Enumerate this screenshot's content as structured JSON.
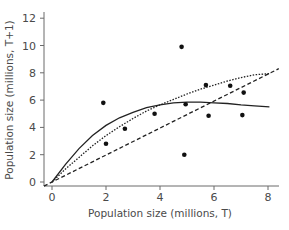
{
  "chart_data": {
    "type": "scatter",
    "title": "",
    "xlabel": "Population size (millions, T)",
    "ylabel": "Population size (millions, T+1)",
    "xlim": [
      -0.3,
      8.3
    ],
    "ylim": [
      -0.3,
      12.5
    ],
    "x_ticks": [
      "0",
      "2",
      "4",
      "6",
      "8"
    ],
    "x_tick_values": [
      0,
      2,
      4,
      6,
      8
    ],
    "y_ticks": [
      "0",
      "2",
      "4",
      "6",
      "8",
      "10",
      "12"
    ],
    "y_tick_values": [
      0,
      2,
      4,
      6,
      8,
      10,
      12
    ],
    "grid": false,
    "legend": null,
    "series": [
      {
        "name": "Observed data",
        "kind": "points",
        "x": [
          1.9,
          2.0,
          2.7,
          3.8,
          4.8,
          4.95,
          4.9,
          5.7,
          5.8,
          6.6,
          7.1,
          7.05
        ],
        "y": [
          5.8,
          2.8,
          3.9,
          5.0,
          9.9,
          5.7,
          2.0,
          7.1,
          4.85,
          7.05,
          6.55,
          4.9
        ]
      },
      {
        "name": "Solid model curve",
        "kind": "line-solid",
        "x": [
          0,
          0.5,
          1,
          1.5,
          2,
          2.5,
          3,
          3.5,
          4,
          4.5,
          5,
          5.5,
          6,
          6.5,
          7,
          7.5,
          8.05
        ],
        "y": [
          0,
          1.3,
          2.45,
          3.4,
          4.15,
          4.7,
          5.1,
          5.45,
          5.65,
          5.8,
          5.85,
          5.85,
          5.8,
          5.75,
          5.65,
          5.58,
          5.5
        ]
      },
      {
        "name": "Dotted model curve",
        "kind": "line-dotted",
        "x": [
          0,
          0.5,
          1,
          1.5,
          2,
          2.5,
          3,
          3.5,
          4,
          4.5,
          5,
          5.5,
          6,
          6.5,
          7,
          7.5,
          8.1
        ],
        "y": [
          0,
          0.95,
          1.8,
          2.65,
          3.4,
          4.05,
          4.65,
          5.2,
          5.65,
          6.05,
          6.45,
          6.8,
          7.1,
          7.4,
          7.65,
          7.85,
          7.95
        ]
      },
      {
        "name": "Dashed reference line (T+1 = T)",
        "kind": "line-dashed",
        "x": [
          -0.3,
          8.4
        ],
        "y": [
          -0.3,
          8.3
        ]
      }
    ]
  }
}
